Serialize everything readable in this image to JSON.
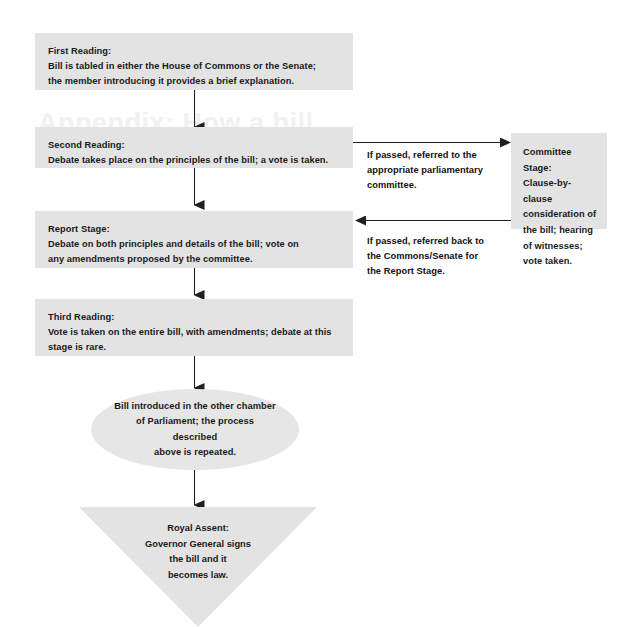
{
  "diagram": {
    "watermark_text": "Appendix: How a bill",
    "colors": {
      "node_fill": "#e3e3e3",
      "ellipse_fill": "#e6e6e6",
      "text": "#1a1a1a",
      "arrow": "#231f20",
      "background": "#ffffff",
      "watermark": "#f1f1f1"
    },
    "nodes": {
      "first_reading": {
        "shape": "rectangle",
        "lines": [
          "First Reading:",
          "Bill is tabled in either the House of Commons or the Senate;",
          "the member introducing it provides a brief explanation."
        ]
      },
      "second_reading": {
        "shape": "rectangle",
        "lines": [
          "Second Reading:",
          "Debate takes place on the principles of the bill; a vote is taken."
        ]
      },
      "report_stage": {
        "shape": "rectangle",
        "lines": [
          "Report Stage:",
          "Debate on both principles and details of the bill; vote on",
          "any amendments proposed by the committee."
        ]
      },
      "third_reading": {
        "shape": "rectangle",
        "lines": [
          "Third Reading:",
          "Vote is taken on the entire bill, with amendments; debate at this",
          "stage is rare."
        ]
      },
      "committee_stage": {
        "shape": "rectangle",
        "lines": [
          "Committee Stage:",
          "Clause-by-clause",
          "consideration of",
          "the bill; hearing",
          "of witnesses;",
          "vote taken."
        ]
      },
      "other_chamber": {
        "shape": "ellipse",
        "lines": [
          "Bill introduced in the other chamber",
          "of Parliament; the process described",
          "above is repeated."
        ]
      },
      "royal_assent": {
        "shape": "inverted-triangle",
        "lines": [
          "Royal Assent:",
          "Governor General signs",
          "the bill and it",
          "becomes law."
        ]
      }
    },
    "edge_labels": {
      "to_committee": [
        "If passed, referred to the",
        "appropriate parliamentary",
        "committee."
      ],
      "back_to_report": [
        "If passed, referred back to",
        "the Commons/Senate for",
        "the Report Stage."
      ]
    }
  }
}
